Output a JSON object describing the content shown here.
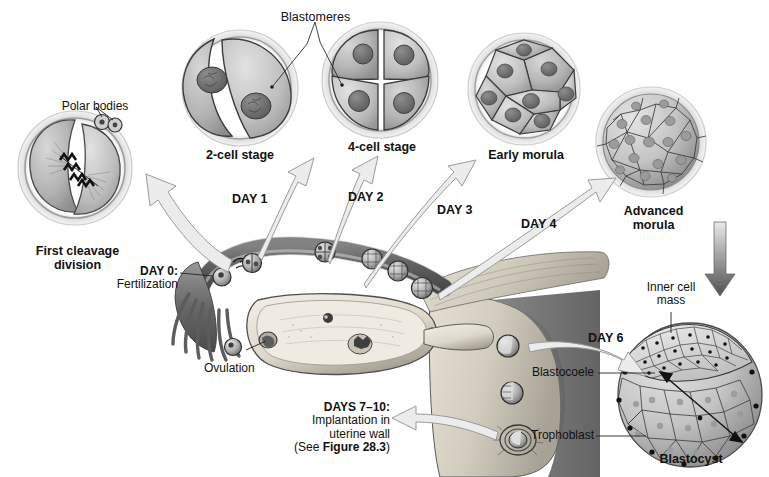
{
  "figure": {
    "background_color": "#ffffff",
    "line_color": "#1a1a1a",
    "arrow_fill": "#e8e8e8",
    "arrow_stroke": "#8c8c8c"
  },
  "stages": [
    {
      "id": "first-cleavage",
      "label": "First cleavage\ndivision",
      "cells": 2,
      "annotation": "Polar bodies"
    },
    {
      "id": "two-cell",
      "label": "2-cell stage",
      "cells": 2,
      "annotation": "Blastomeres"
    },
    {
      "id": "four-cell",
      "label": "4-cell stage",
      "cells": 4,
      "annotation": "Blastomeres"
    },
    {
      "id": "early-morula",
      "label": "Early morula",
      "cells": 8
    },
    {
      "id": "advanced-morula",
      "label": "Advanced\nmorula",
      "cells": 30
    },
    {
      "id": "blastocyst",
      "label": "Blastocyst",
      "cells": 40
    }
  ],
  "labels": {
    "polar_bodies": "Polar bodies",
    "blastomeres": "Blastomeres",
    "first_cleavage_line1": "First cleavage",
    "first_cleavage_line2": "division",
    "two_cell_stage": "2-cell stage",
    "four_cell_stage": "4-cell stage",
    "early_morula": "Early morula",
    "advanced_morula_line1": "Advanced",
    "advanced_morula_line2": "morula",
    "inner_cell_mass_line1": "Inner cell",
    "inner_cell_mass_line2": "mass",
    "blastocoele": "Blastocoele",
    "trophoblast": "Trophoblast",
    "blastocyst": "Blastocyst",
    "ovulation": "Ovulation"
  },
  "timeline": {
    "day0_bold": "DAY 0:",
    "day0_text": "Fertilization",
    "day1": "DAY 1",
    "day2": "DAY 2",
    "day3": "DAY 3",
    "day4": "DAY 4",
    "day6": "DAY 6",
    "days7to10_bold": "DAYS 7–10:",
    "days7to10_line1": "Implantation in",
    "days7to10_line2": "uterine wall",
    "days7to10_ref_prefix": "(See ",
    "days7to10_ref_bold": "Figure 28.3",
    "days7to10_ref_suffix": ")"
  },
  "anatomy": {
    "oviduct": "fallopian-tube",
    "fimbriae": "fimbriae",
    "ovary": "ovary",
    "uterus": "uterine-wall",
    "endometrium": "endometrium"
  }
}
